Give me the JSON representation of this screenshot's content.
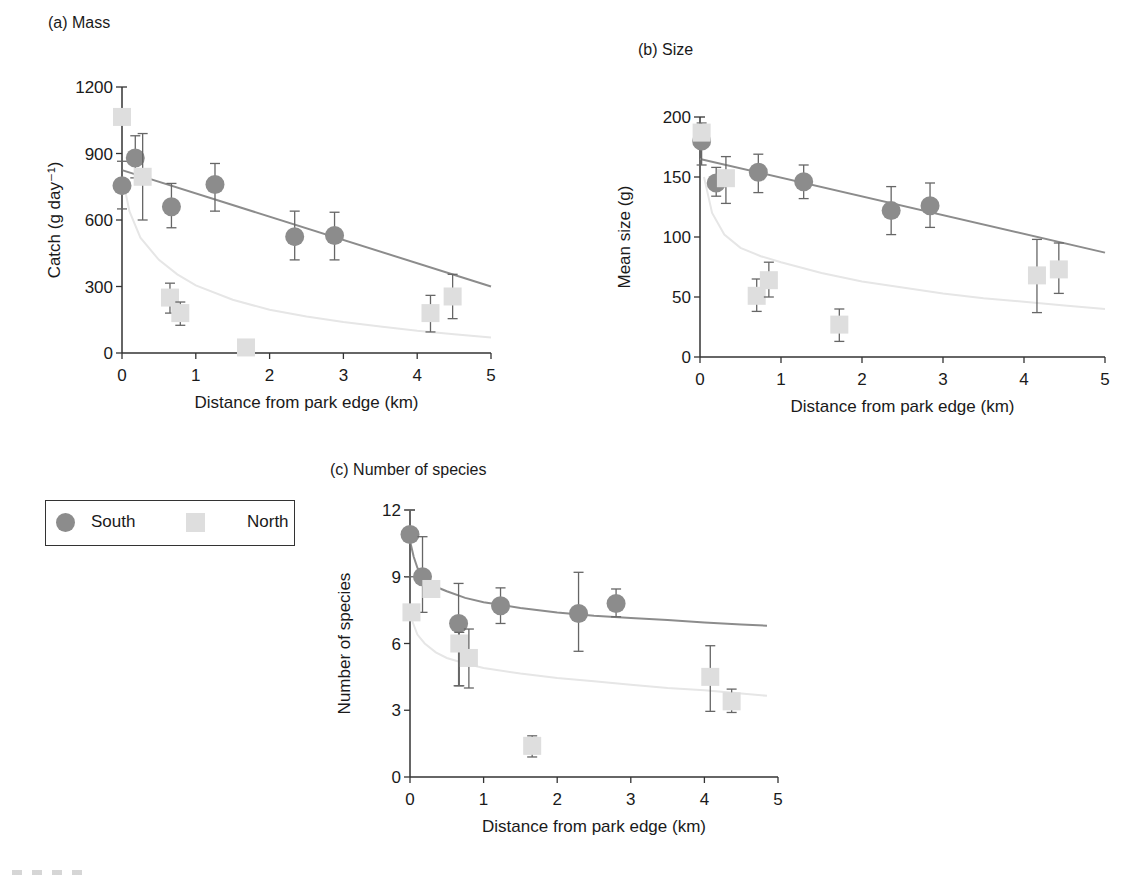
{
  "colors": {
    "south_marker": "#8c8c8c",
    "south_line": "#8c8c8c",
    "north_marker": "#dedede",
    "north_line": "#e6e6e6",
    "axis": "#333333",
    "errorbar": "#666666"
  },
  "legend": {
    "items": [
      {
        "label": "South",
        "shape": "circle"
      },
      {
        "label": "North",
        "shape": "square"
      }
    ]
  },
  "chart_data": [
    {
      "id": "a",
      "type": "scatter",
      "title": "(a) Mass",
      "xlabel": "Distance from park edge (km)",
      "ylabel": "Catch (g day⁻¹)",
      "xlim": [
        0,
        5
      ],
      "ylim": [
        0,
        1200
      ],
      "xticks": [
        0,
        1,
        2,
        3,
        4,
        5
      ],
      "yticks": [
        0,
        300,
        600,
        900,
        1200
      ],
      "grid": false,
      "px": {
        "x0": 122,
        "x1": 491,
        "y0": 353,
        "y1": 87
      },
      "series": [
        {
          "name": "South",
          "marker": "circle",
          "points": [
            {
              "x": 0.0,
              "y": 755,
              "lo": 650,
              "hi": 865
            },
            {
              "x": 0.18,
              "y": 880,
              "lo": 790,
              "hi": 980
            },
            {
              "x": 0.67,
              "y": 660,
              "lo": 565,
              "hi": 765
            },
            {
              "x": 1.26,
              "y": 760,
              "lo": 640,
              "hi": 855
            },
            {
              "x": 2.34,
              "y": 525,
              "lo": 420,
              "hi": 640
            },
            {
              "x": 2.88,
              "y": 530,
              "lo": 420,
              "hi": 635
            }
          ],
          "fit": {
            "kind": "linear",
            "x": [
              0,
              5
            ],
            "y": [
              825,
              300
            ]
          }
        },
        {
          "name": "North",
          "marker": "square",
          "points": [
            {
              "x": 0.0,
              "y": 1065,
              "lo": null,
              "hi": null
            },
            {
              "x": 0.28,
              "y": 795,
              "lo": 600,
              "hi": 990
            },
            {
              "x": 0.65,
              "y": 250,
              "lo": 180,
              "hi": 315
            },
            {
              "x": 0.79,
              "y": 180,
              "lo": 125,
              "hi": 230
            },
            {
              "x": 1.68,
              "y": 25,
              "lo": null,
              "hi": null
            },
            {
              "x": 4.18,
              "y": 180,
              "lo": 95,
              "hi": 260
            },
            {
              "x": 4.48,
              "y": 255,
              "lo": 155,
              "hi": 355
            }
          ],
          "fit": {
            "kind": "log-decay",
            "x": [
              0.02,
              0.1,
              0.25,
              0.5,
              0.75,
              1,
              1.5,
              2,
              2.5,
              3,
              3.5,
              4,
              4.5,
              5
            ],
            "y": [
              770,
              640,
              520,
              420,
              355,
              305,
              240,
              195,
              165,
              140,
              120,
              100,
              85,
              70
            ]
          }
        }
      ]
    },
    {
      "id": "b",
      "type": "scatter",
      "title": "(b) Size",
      "xlabel": "Distance from park edge (km)",
      "ylabel": "Mean size (g)",
      "xlim": [
        0,
        5
      ],
      "ylim": [
        0,
        200
      ],
      "xticks": [
        0,
        1,
        2,
        3,
        4,
        5
      ],
      "yticks": [
        0,
        50,
        100,
        150,
        200
      ],
      "grid": false,
      "px": {
        "x0": 700,
        "x1": 1105,
        "y0": 357,
        "y1": 117
      },
      "series": [
        {
          "name": "South",
          "marker": "circle",
          "points": [
            {
              "x": 0.02,
              "y": 180,
              "lo": 160,
              "hi": 195
            },
            {
              "x": 0.2,
              "y": 145,
              "lo": 134,
              "hi": 158
            },
            {
              "x": 0.72,
              "y": 154,
              "lo": 137,
              "hi": 169
            },
            {
              "x": 1.28,
              "y": 146,
              "lo": 132,
              "hi": 160
            },
            {
              "x": 2.36,
              "y": 122,
              "lo": 102,
              "hi": 142
            },
            {
              "x": 2.84,
              "y": 126,
              "lo": 108,
              "hi": 145
            }
          ],
          "fit": {
            "kind": "linear",
            "x": [
              0,
              5
            ],
            "y": [
              165,
              87
            ]
          }
        },
        {
          "name": "North",
          "marker": "square",
          "points": [
            {
              "x": 0.02,
              "y": 187,
              "lo": null,
              "hi": null
            },
            {
              "x": 0.32,
              "y": 149,
              "lo": 128,
              "hi": 167
            },
            {
              "x": 0.7,
              "y": 51,
              "lo": 38,
              "hi": 65
            },
            {
              "x": 0.85,
              "y": 64,
              "lo": 50,
              "hi": 79
            },
            {
              "x": 1.72,
              "y": 27,
              "lo": 13,
              "hi": 40
            },
            {
              "x": 4.16,
              "y": 68,
              "lo": 37,
              "hi": 98
            },
            {
              "x": 4.43,
              "y": 73,
              "lo": 53,
              "hi": 95
            }
          ],
          "fit": {
            "kind": "log-decay",
            "x": [
              0.05,
              0.15,
              0.3,
              0.5,
              0.75,
              1,
              1.5,
              2,
              2.5,
              3,
              3.5,
              4,
              4.5,
              5
            ],
            "y": [
              150,
              120,
              102,
              91,
              84,
              79,
              70,
              63,
              58,
              53,
              49,
              46,
              43,
              40
            ]
          }
        }
      ]
    },
    {
      "id": "c",
      "type": "scatter",
      "title": "(c) Number of species",
      "xlabel": "Distance from park edge (km)",
      "ylabel": "Number of species",
      "xlim": [
        0,
        5
      ],
      "ylim": [
        0,
        12
      ],
      "xticks": [
        0,
        1,
        2,
        3,
        4,
        5
      ],
      "yticks": [
        0,
        3,
        6,
        9,
        12
      ],
      "grid": false,
      "px": {
        "x0": 410,
        "x1": 778,
        "y0": 777,
        "y1": 510
      },
      "series": [
        {
          "name": "South",
          "marker": "circle",
          "points": [
            {
              "x": 0.0,
              "y": 10.9,
              "lo": 9.0,
              "hi": 12.0
            },
            {
              "x": 0.17,
              "y": 9.0,
              "lo": 7.4,
              "hi": 10.8
            },
            {
              "x": 0.66,
              "y": 6.9,
              "lo": 4.1,
              "hi": 8.7
            },
            {
              "x": 1.23,
              "y": 7.7,
              "lo": 6.9,
              "hi": 8.5
            },
            {
              "x": 2.29,
              "y": 7.35,
              "lo": 5.65,
              "hi": 9.2
            },
            {
              "x": 2.8,
              "y": 7.8,
              "lo": 7.2,
              "hi": 8.45
            }
          ],
          "fit": {
            "kind": "log-decay",
            "x": [
              0.0,
              0.05,
              0.1,
              0.2,
              0.35,
              0.5,
              0.75,
              1,
              1.5,
              2,
              2.5,
              3,
              3.5,
              4,
              4.5,
              4.85
            ],
            "y": [
              10.6,
              9.9,
              9.4,
              8.9,
              8.55,
              8.35,
              8.05,
              7.85,
              7.6,
              7.4,
              7.25,
              7.15,
              7.05,
              6.95,
              6.85,
              6.8
            ]
          }
        },
        {
          "name": "North",
          "marker": "square",
          "points": [
            {
              "x": 0.02,
              "y": 7.4,
              "lo": null,
              "hi": null
            },
            {
              "x": 0.29,
              "y": 8.45,
              "lo": null,
              "hi": null
            },
            {
              "x": 0.67,
              "y": 6.0,
              "lo": 4.1,
              "hi": 6.5
            },
            {
              "x": 0.8,
              "y": 5.35,
              "lo": 4.0,
              "hi": 6.65
            },
            {
              "x": 1.66,
              "y": 1.4,
              "lo": 0.9,
              "hi": 1.85
            },
            {
              "x": 4.08,
              "y": 4.5,
              "lo": 2.95,
              "hi": 5.9
            },
            {
              "x": 4.37,
              "y": 3.4,
              "lo": 2.9,
              "hi": 3.95
            }
          ],
          "fit": {
            "kind": "log-decay",
            "x": [
              0.02,
              0.1,
              0.2,
              0.35,
              0.5,
              0.75,
              1,
              1.5,
              2,
              2.5,
              3,
              3.5,
              4,
              4.5,
              4.85
            ],
            "y": [
              7.1,
              6.4,
              6.0,
              5.6,
              5.35,
              5.1,
              4.9,
              4.65,
              4.45,
              4.3,
              4.15,
              4.0,
              3.9,
              3.75,
              3.65
            ]
          }
        }
      ]
    }
  ]
}
